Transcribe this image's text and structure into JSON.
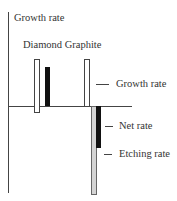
{
  "diagram": {
    "y_axis_label": "Growth rate",
    "group_labels": "Diamond Graphite",
    "groups": [
      {
        "name": "Diamond",
        "bars": [
          {
            "role": "growth",
            "style": "white"
          },
          {
            "role": "net",
            "style": "black"
          }
        ]
      },
      {
        "name": "Graphite",
        "bars": [
          {
            "role": "growth",
            "style": "white"
          },
          {
            "role": "etching",
            "style": "gray"
          },
          {
            "role": "net",
            "style": "black"
          }
        ]
      }
    ],
    "annotations": {
      "growth_rate": "Growth rate",
      "net_rate": "Net rate",
      "etching_rate": "Etching rate"
    },
    "colors": {
      "growth": "#ffffff",
      "net": "#111111",
      "etching": "#d4d4d4",
      "axis": "#444444"
    }
  }
}
